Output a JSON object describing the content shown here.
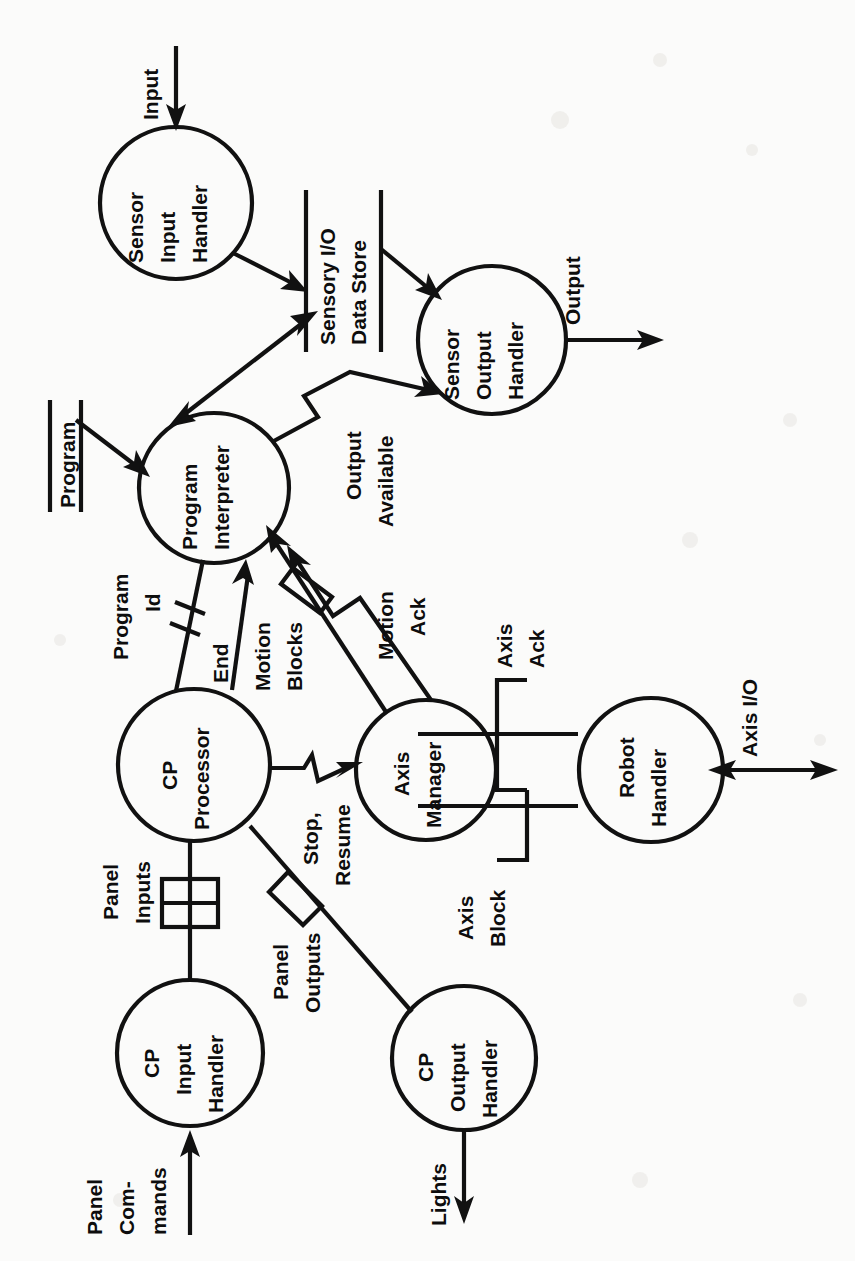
{
  "diagram": {
    "orientation": "rotated-90-clockwise",
    "type": "data-flow-diagram",
    "nodes": [
      {
        "id": "sensor-input-handler",
        "label": "Sensor\nInput\nHandler",
        "lines": [
          "Sensor",
          "Input",
          "Handler"
        ],
        "shape": "circle",
        "cx": 176,
        "cy": 203,
        "r": 76
      },
      {
        "id": "sensor-output-handler",
        "label": "Sensor\nOutput\nHandler",
        "lines": [
          "Sensor",
          "Output",
          "Handler"
        ],
        "shape": "circle",
        "cx": 492,
        "cy": 340,
        "r": 74
      },
      {
        "id": "program-interpreter",
        "label": "Program\nInterpreter",
        "lines": [
          "Program",
          "Interpreter"
        ],
        "shape": "circle",
        "cx": 214,
        "cy": 488,
        "r": 75
      },
      {
        "id": "cp-processor",
        "label": "CP\nProcessor",
        "lines": [
          "CP",
          "Processor"
        ],
        "shape": "circle",
        "cx": 194,
        "cy": 765,
        "r": 76
      },
      {
        "id": "axis-manager",
        "label": "Axis\nManager",
        "lines": [
          "Axis",
          "Manager"
        ],
        "shape": "circle",
        "cx": 426,
        "cy": 770,
        "r": 70
      },
      {
        "id": "robot-handler",
        "label": "Robot\nHandler",
        "lines": [
          "Robot",
          "Handler"
        ],
        "shape": "circle",
        "cx": 651,
        "cy": 770,
        "r": 72
      },
      {
        "id": "cp-input-handler",
        "label": "CP\nInput\nHandler",
        "lines": [
          "CP",
          "Input",
          "Handler"
        ],
        "shape": "circle",
        "cx": 190,
        "cy": 1053,
        "r": 73
      },
      {
        "id": "cp-output-handler",
        "label": "CP\nOutput\nHandler",
        "lines": [
          "CP",
          "Output",
          "Handler"
        ],
        "shape": "circle",
        "cx": 464,
        "cy": 1058,
        "r": 72
      }
    ],
    "stores": [
      {
        "id": "sensory-io-data-store",
        "label": "Sensory I/O\nData Store",
        "lines": [
          "Sensory I/O",
          "Data Store"
        ]
      },
      {
        "id": "program-store",
        "label": "Program",
        "lines": [
          "Program"
        ]
      }
    ],
    "flows": [
      {
        "id": "input",
        "label": "Input",
        "lines": [
          "Input"
        ],
        "from": "external",
        "to": "sensor-input-handler"
      },
      {
        "id": "sensor-in-to-store",
        "label": "",
        "from": "sensor-input-handler",
        "to": "sensory-io-data-store"
      },
      {
        "id": "store-to-sensor-out",
        "label": "",
        "from": "sensory-io-data-store",
        "to": "sensor-output-handler"
      },
      {
        "id": "output",
        "label": "Output",
        "lines": [
          "Output"
        ],
        "from": "sensor-output-handler",
        "to": "external"
      },
      {
        "id": "interpreter-store",
        "label": "",
        "from": "program-interpreter",
        "to": "sensory-io-data-store",
        "bidirectional": true
      },
      {
        "id": "program-to-interpreter",
        "label": "",
        "from": "program-store",
        "to": "program-interpreter"
      },
      {
        "id": "output-available",
        "label": "Output\nAvailable",
        "lines": [
          "Output",
          "Available"
        ],
        "from": "program-interpreter",
        "to": "sensor-output-handler"
      },
      {
        "id": "program-id",
        "label": "Program\nId",
        "lines": [
          "Program",
          "Id"
        ],
        "from": "cp-processor",
        "to": "program-interpreter"
      },
      {
        "id": "end",
        "label": "End",
        "lines": [
          "End"
        ],
        "from": "program-interpreter",
        "to": "cp-processor"
      },
      {
        "id": "motion-blocks",
        "label": "Motion\nBlocks",
        "lines": [
          "Motion",
          "Blocks"
        ],
        "from": "program-interpreter",
        "to": "axis-manager"
      },
      {
        "id": "motion-ack",
        "label": "Motion\nAck",
        "lines": [
          "Motion",
          "Ack"
        ],
        "from": "axis-manager",
        "to": "program-interpreter"
      },
      {
        "id": "stop-resume",
        "label": "Stop,\nResume",
        "lines": [
          "Stop,",
          "Resume"
        ],
        "from": "cp-processor",
        "to": "axis-manager"
      },
      {
        "id": "axis-ack",
        "label": "Axis\nAck",
        "lines": [
          "Axis",
          "Ack"
        ],
        "from": "robot-handler",
        "to": "axis-manager"
      },
      {
        "id": "axis-block",
        "label": "Axis\nBlock",
        "lines": [
          "Axis",
          "Block"
        ],
        "from": "axis-manager",
        "to": "robot-handler"
      },
      {
        "id": "axis-io",
        "label": "Axis I/O",
        "lines": [
          "Axis I/O"
        ],
        "from": "robot-handler",
        "to": "external",
        "bidirectional": true
      },
      {
        "id": "panel-inputs",
        "label": "Panel\nInputs",
        "lines": [
          "Panel",
          "Inputs"
        ],
        "from": "cp-input-handler",
        "to": "cp-processor"
      },
      {
        "id": "panel-outputs",
        "label": "Panel\nOutputs",
        "lines": [
          "Panel",
          "Outputs"
        ],
        "from": "cp-processor",
        "to": "cp-output-handler"
      },
      {
        "id": "panel-commands",
        "label": "Panel\nCom-\nmands",
        "lines": [
          "Panel",
          "Com-",
          "mands"
        ],
        "from": "external",
        "to": "cp-input-handler"
      },
      {
        "id": "lights",
        "label": "Lights",
        "lines": [
          "Lights"
        ],
        "from": "cp-output-handler",
        "to": "external"
      }
    ],
    "colors": {
      "ink": "#111111",
      "paper": "#fbfbfa"
    }
  }
}
